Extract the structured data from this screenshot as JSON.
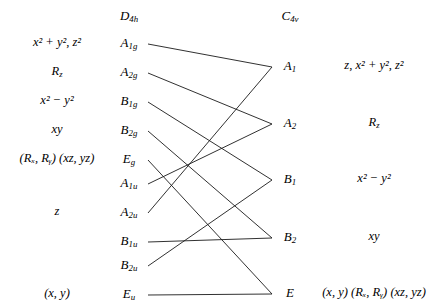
{
  "diagram": {
    "left_group": "D₄ₕ",
    "right_group": "C₄ᵥ",
    "line_color": "#1a1a1a",
    "background": "#ffffff"
  },
  "left_column": {
    "header": "D",
    "header_sub": "4h",
    "rows": [
      {
        "species": "A",
        "species_sub": "1g",
        "functions": "x² + y², z²",
        "y": 44
      },
      {
        "species": "A",
        "species_sub": "2g",
        "functions": "R",
        "functions_sub": "z",
        "y": 73
      },
      {
        "species": "B",
        "species_sub": "1g",
        "functions": "x² − y²",
        "y": 102
      },
      {
        "species": "B",
        "species_sub": "2g",
        "functions": "xy",
        "y": 131
      },
      {
        "species": "E",
        "species_sub": "g",
        "functions": "(Rₓ, Rᵧ) (xz, yz)",
        "y": 160
      },
      {
        "species": "A",
        "species_sub": "1u",
        "functions": "",
        "y": 184
      },
      {
        "species": "A",
        "species_sub": "2u",
        "functions": "z",
        "y": 213
      },
      {
        "species": "B",
        "species_sub": "1u",
        "functions": "",
        "y": 242
      },
      {
        "species": "B",
        "species_sub": "2u",
        "functions": "",
        "y": 266
      },
      {
        "species": "E",
        "species_sub": "u",
        "functions": "(x, y)",
        "y": 295
      }
    ]
  },
  "right_column": {
    "header": "C",
    "header_sub": "4v",
    "rows": [
      {
        "species": "A",
        "species_sub": "1",
        "functions": "z, x² + y², z²",
        "y": 67
      },
      {
        "species": "A",
        "species_sub": "2",
        "functions": "R",
        "functions_sub": "z",
        "y": 124
      },
      {
        "species": "B",
        "species_sub": "1",
        "functions": "x² − y²",
        "y": 180
      },
      {
        "species": "B",
        "species_sub": "2",
        "functions": "xy",
        "y": 238
      },
      {
        "species": "E",
        "species_sub": "",
        "functions": "(x, y) (Rₓ, Rᵧ) (xz, yz)",
        "y": 294
      }
    ]
  },
  "correlations": [
    {
      "from": "A1g",
      "to": "A1",
      "x1": 148,
      "y1": 44,
      "x2": 272,
      "y2": 67
    },
    {
      "from": "A2g",
      "to": "A2",
      "x1": 148,
      "y1": 73,
      "x2": 272,
      "y2": 124
    },
    {
      "from": "B1g",
      "to": "B1",
      "x1": 148,
      "y1": 102,
      "x2": 272,
      "y2": 180
    },
    {
      "from": "B2g",
      "to": "B2",
      "x1": 148,
      "y1": 131,
      "x2": 272,
      "y2": 238
    },
    {
      "from": "Eg",
      "to": "E",
      "x1": 148,
      "y1": 160,
      "x2": 272,
      "y2": 294
    },
    {
      "from": "A1u",
      "to": "A2",
      "x1": 148,
      "y1": 184,
      "x2": 272,
      "y2": 124
    },
    {
      "from": "A2u",
      "to": "A1",
      "x1": 148,
      "y1": 213,
      "x2": 272,
      "y2": 67
    },
    {
      "from": "B1u",
      "to": "B2",
      "x1": 148,
      "y1": 242,
      "x2": 272,
      "y2": 238
    },
    {
      "from": "B2u",
      "to": "B1",
      "x1": 148,
      "y1": 266,
      "x2": 272,
      "y2": 180
    },
    {
      "from": "Eu",
      "to": "E",
      "x1": 148,
      "y1": 295,
      "x2": 272,
      "y2": 294
    }
  ]
}
